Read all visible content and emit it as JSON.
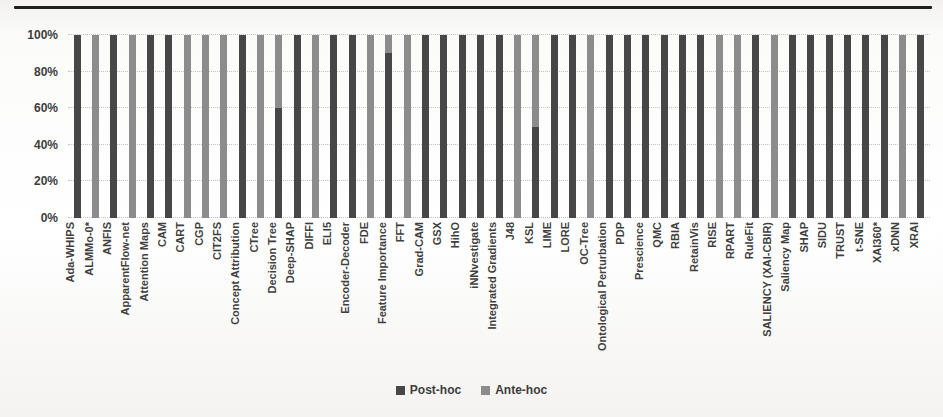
{
  "figure": {
    "top_rule_color": "#1e1e1e",
    "background": "#f6f5f3"
  },
  "chart_data": {
    "type": "bar",
    "stacked": true,
    "percent_scale": true,
    "title": "",
    "xlabel": "",
    "ylabel": "",
    "ylim": [
      0,
      100
    ],
    "grid": "horizontal-dotted",
    "legend_position": "bottom-center",
    "y_ticks": [
      "0%",
      "20%",
      "40%",
      "60%",
      "80%",
      "100%"
    ],
    "y_tick_values": [
      0,
      20,
      40,
      60,
      80,
      100
    ],
    "categories": [
      "Ada-WHIPS",
      "ALMMo-0*",
      "ANFIS",
      "ApparentFlow-net",
      "Attention Maps",
      "CAM",
      "CART",
      "CGP",
      "CIT2FS",
      "Concept Attribution",
      "CTree",
      "Decision Tree",
      "Deep-SHAP",
      "DIFFI",
      "ELI5",
      "Encoder-Decoder",
      "FDE",
      "Feature Importance",
      "FFT",
      "Grad-CAM",
      "GSX",
      "HihO",
      "iNNvestigate",
      "Integrated Gradients",
      "J48",
      "KSL",
      "LIME",
      "LORE",
      "OC-Tree",
      "Ontological Perturbation",
      "PDP",
      "Prescience",
      "QMC",
      "RBIA",
      "RetainVis",
      "RISE",
      "RPART",
      "RuleFit",
      "SALIENCY (XAI-CBIR)",
      "Saliency Map",
      "SHAP",
      "SIDU",
      "TRUST",
      "t-SNE",
      "XAI360*",
      "xDNN",
      "XRAI"
    ],
    "series": [
      {
        "name": "Post-hoc",
        "color": "#474747",
        "values": [
          100,
          0,
          100,
          0,
          100,
          100,
          0,
          0,
          0,
          100,
          0,
          60,
          100,
          0,
          100,
          100,
          0,
          90,
          0,
          100,
          100,
          100,
          100,
          100,
          0,
          50,
          100,
          100,
          0,
          100,
          100,
          100,
          100,
          100,
          100,
          0,
          0,
          100,
          0,
          100,
          100,
          100,
          100,
          100,
          100,
          0,
          100
        ]
      },
      {
        "name": "Ante-hoc",
        "color": "#8c8c8c",
        "values": [
          0,
          100,
          0,
          100,
          0,
          0,
          100,
          100,
          100,
          0,
          100,
          40,
          0,
          100,
          0,
          0,
          100,
          10,
          100,
          0,
          0,
          0,
          0,
          0,
          100,
          50,
          0,
          0,
          100,
          0,
          0,
          0,
          0,
          0,
          0,
          100,
          100,
          0,
          100,
          0,
          0,
          0,
          0,
          0,
          0,
          100,
          0
        ]
      }
    ]
  }
}
